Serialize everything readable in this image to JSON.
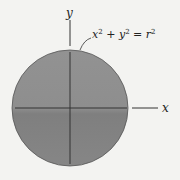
{
  "diagram": {
    "colors": {
      "background": "#f3f3f1",
      "disk_fill": "#8c8c8c",
      "disk_stroke": "#555555",
      "axis": "#333333"
    },
    "axes": {
      "x_label": "x",
      "y_label": "y"
    },
    "equation": {
      "base_x": "x",
      "base_y": "y",
      "exp": "2",
      "plus": " + ",
      "equals": " = ",
      "base_r": "r"
    },
    "circle": {
      "cx": 70,
      "cy": 108,
      "r": 58
    }
  }
}
